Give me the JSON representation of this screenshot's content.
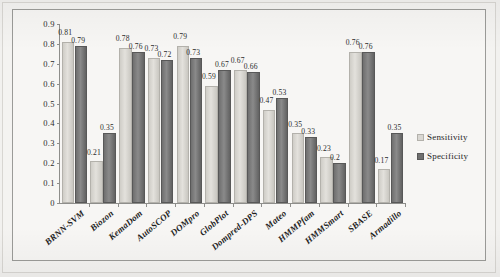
{
  "chart_data": {
    "type": "bar",
    "title": "",
    "subtitle": "",
    "xlabel": "",
    "ylabel": "",
    "ylim": [
      0,
      0.9
    ],
    "grid": false,
    "legend_position": "right",
    "y_ticks": [
      "0",
      "0.1",
      "0.2",
      "0.3",
      "0.4",
      "0.5",
      "0.6",
      "0.7",
      "0.8",
      "0.9"
    ],
    "categories": [
      "BRNN-SVM",
      "Biozon",
      "KemaDom",
      "AutoSCOP",
      "DOMpro",
      "GlobPlot",
      "Dompred-DPS",
      "Mateo",
      "HMMPfam",
      "HMMSmart",
      "SBASE",
      "Armadillo"
    ],
    "series": [
      {
        "name": "Sensitivity",
        "color": "#d9d7d2",
        "values": [
          0.81,
          0.21,
          0.78,
          0.73,
          0.79,
          0.59,
          0.67,
          0.47,
          0.35,
          0.23,
          0.76,
          0.17
        ],
        "labels": [
          "0.81",
          "0.21",
          "0.78",
          "0.73",
          "0.79",
          "0.59",
          "0.67",
          "0.47",
          "0.35",
          "0.23",
          "0.76",
          "0.17"
        ]
      },
      {
        "name": "Specificity",
        "color": "#6f6f6f",
        "values": [
          0.79,
          0.35,
          0.76,
          0.72,
          0.73,
          0.67,
          0.66,
          0.53,
          0.33,
          0.2,
          0.76,
          0.35
        ],
        "labels": [
          "0.79",
          "0.35",
          "0.76",
          "0.72",
          "0.73",
          "0.67",
          "0.66",
          "0.53",
          "0.33",
          "0.2",
          "0.76",
          "0.35"
        ]
      }
    ]
  },
  "legend": {
    "items": [
      {
        "label": "Sensitivity"
      },
      {
        "label": "Specificity"
      }
    ]
  }
}
